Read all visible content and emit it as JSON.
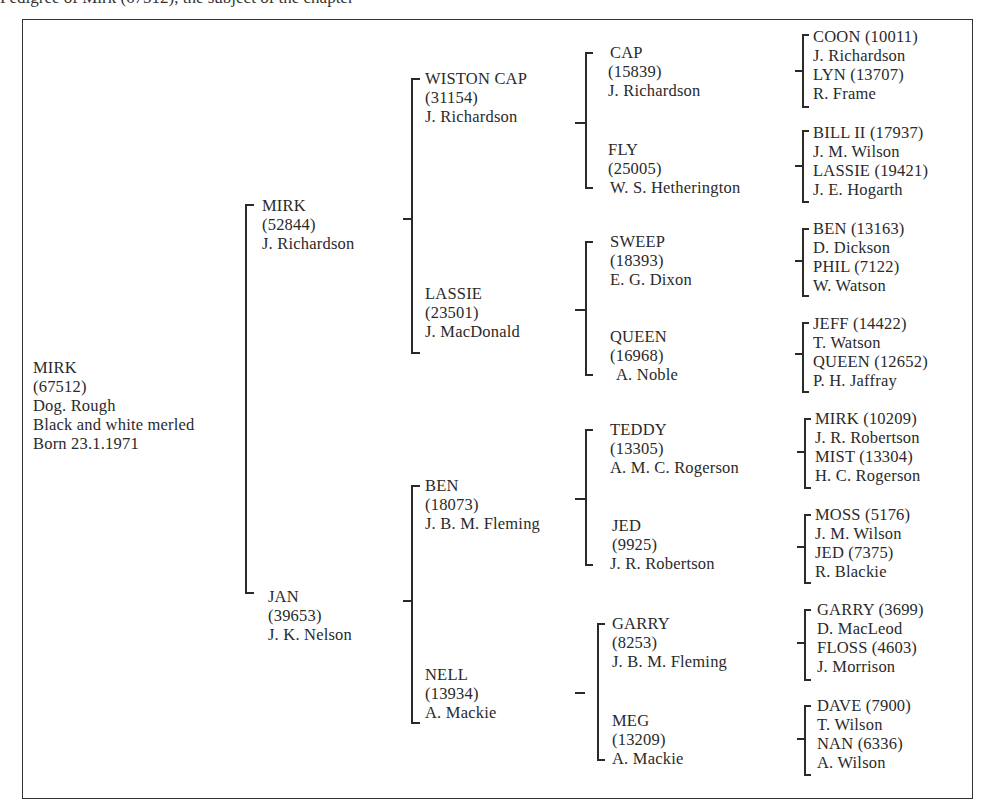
{
  "caption_cut": "Pedigree of Mirk (67512), the subject of the chapter",
  "subject": {
    "name": "MIRK",
    "reg": "(67512)",
    "lines": [
      "Dog. Rough",
      "Black and white merled",
      "Born 23.1.1971"
    ]
  },
  "parents": [
    {
      "name": "MIRK",
      "reg": "(52844)",
      "breeder": "J. Richardson"
    },
    {
      "name": "JAN",
      "reg": "(39653)",
      "breeder": "J. K. Nelson"
    }
  ],
  "grandparents": [
    {
      "name": "WISTON CAP",
      "reg": "(31154)",
      "breeder": "J. Richardson"
    },
    {
      "name": "LASSIE",
      "reg": "(23501)",
      "breeder": "J. MacDonald"
    },
    {
      "name": "BEN",
      "reg": "(18073)",
      "breeder": "J. B. M. Fleming"
    },
    {
      "name": "NELL",
      "reg": "(13934)",
      "breeder": "A. Mackie"
    }
  ],
  "great_grandparents": [
    {
      "name": "CAP",
      "reg": "(15839)",
      "breeder": "J. Richardson"
    },
    {
      "name": "FLY",
      "reg": "(25005)",
      "breeder": "W. S. Hetherington"
    },
    {
      "name": "SWEEP",
      "reg": "(18393)",
      "breeder": "E. G. Dixon"
    },
    {
      "name": "QUEEN",
      "reg": "(16968)",
      "breeder": "A. Noble"
    },
    {
      "name": "TEDDY",
      "reg": "(13305)",
      "breeder": "A. M. C. Rogerson"
    },
    {
      "name": "JED",
      "reg": "(9925)",
      "breeder": "J. R. Robertson"
    },
    {
      "name": "GARRY",
      "reg": "(8253)",
      "breeder": "J. B. M. Fleming"
    },
    {
      "name": "MEG",
      "reg": "(13209)",
      "breeder": "A. Mackie"
    }
  ],
  "great_great_grandparents": [
    {
      "sire": "COON (10011)",
      "sire_breeder": "J. Richardson",
      "dam": "LYN (13707)",
      "dam_breeder": "R. Frame"
    },
    {
      "sire": "BILL II (17937)",
      "sire_breeder": "J. M. Wilson",
      "dam": "LASSIE (19421)",
      "dam_breeder": "J. E. Hogarth"
    },
    {
      "sire": "BEN (13163)",
      "sire_breeder": "D. Dickson",
      "dam": "PHIL (7122)",
      "dam_breeder": "W. Watson"
    },
    {
      "sire": "JEFF (14422)",
      "sire_breeder": "T. Watson",
      "dam": "QUEEN (12652)",
      "dam_breeder": "P. H. Jaffray"
    },
    {
      "sire": "MIRK (10209)",
      "sire_breeder": "J. R. Robertson",
      "dam": "MIST (13304)",
      "dam_breeder": "H. C. Rogerson"
    },
    {
      "sire": "MOSS (5176)",
      "sire_breeder": "J. M. Wilson",
      "dam": "JED (7375)",
      "dam_breeder": "R. Blackie"
    },
    {
      "sire": "GARRY (3699)",
      "sire_breeder": "D. MacLeod",
      "dam": "FLOSS (4603)",
      "dam_breeder": "J. Morrison"
    },
    {
      "sire": "DAVE (7900)",
      "sire_breeder": "T. Wilson",
      "dam": "NAN (6336)",
      "dam_breeder": "A. Wilson"
    }
  ]
}
